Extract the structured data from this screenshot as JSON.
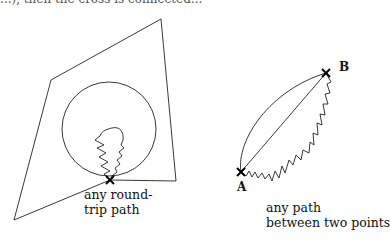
{
  "top_text": "...), then the cross is connected...",
  "left_figure": {
    "caption_line1": "any round-",
    "caption_line2": "trip path"
  },
  "right_figure": {
    "point_a": "A",
    "point_b": "B",
    "caption_line1": "any path",
    "caption_line2": "between two points"
  }
}
